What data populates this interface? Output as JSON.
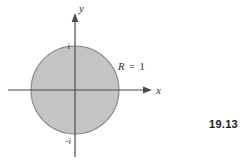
{
  "figure": {
    "number": "19.13",
    "background_color": "#ffffff",
    "axes": {
      "x_label": "x",
      "y_label": "y",
      "line_color": "#4a4a4a"
    },
    "ticks": {
      "positive_imaginary": "i",
      "negative_imaginary": "-i"
    },
    "region": {
      "radius_label_symbol": "R",
      "radius_label_equals": "=",
      "radius_label_value": "1",
      "radius_label_full": "R = 1",
      "fill_color": "#c4c4c4",
      "stroke_color": "#8a8a8a"
    }
  }
}
